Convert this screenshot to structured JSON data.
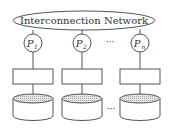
{
  "diagram": {
    "network_label": "Interconnection Network",
    "processors": [
      {
        "label": "P",
        "sub": "1"
      },
      {
        "label": "P",
        "sub": "2"
      },
      {
        "label": "P",
        "sub": "n"
      }
    ],
    "ellipsis_processors": "···",
    "ellipsis_disks": "···",
    "colors": {
      "stroke": "#555555",
      "disk_top": "#d8d8d8"
    }
  }
}
